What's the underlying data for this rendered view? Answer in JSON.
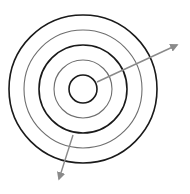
{
  "diagram": {
    "type": "concentric-circles-with-arrows",
    "center": [
      83,
      89
    ],
    "circles": [
      {
        "r": 14,
        "color": "#1a1a1a",
        "width": 1.6
      },
      {
        "r": 29,
        "color": "#6e6e6e",
        "width": 1.1
      },
      {
        "r": 44,
        "color": "#1a1a1a",
        "width": 1.6
      },
      {
        "r": 59,
        "color": "#6e6e6e",
        "width": 1.1
      },
      {
        "r": 74,
        "color": "#1a1a1a",
        "width": 1.6
      }
    ],
    "arrows": [
      {
        "from": [
          97,
          82
        ],
        "to": [
          177,
          45
        ],
        "color": "#8a8a8a"
      },
      {
        "from": [
          73,
          135
        ],
        "to": [
          59,
          179
        ],
        "color": "#8a8a8a"
      }
    ]
  }
}
